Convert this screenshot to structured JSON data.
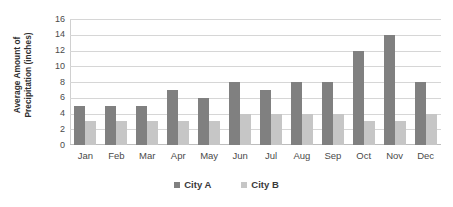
{
  "chart_data": {
    "type": "bar",
    "title": "",
    "xlabel": "",
    "ylabel": "Average Amount of Precipitation (inches)",
    "ylabel_line1": "Average Amount of",
    "ylabel_line2": "Precipitation (inches)",
    "categories": [
      "Jan",
      "Feb",
      "Mar",
      "Apr",
      "May",
      "Jun",
      "Jul",
      "Aug",
      "Sep",
      "Oct",
      "Nov",
      "Dec"
    ],
    "series": [
      {
        "name": "City A",
        "color": "#808080",
        "values": [
          5,
          5,
          5,
          7,
          6,
          8,
          7,
          8,
          8,
          12,
          14,
          8
        ]
      },
      {
        "name": "City B",
        "color": "#c6c6c6",
        "values": [
          3,
          3,
          3,
          3,
          3,
          4,
          4,
          4,
          4,
          3,
          3,
          4
        ]
      }
    ],
    "ylim": [
      0,
      16
    ],
    "ytick_values": [
      16,
      14,
      12,
      10,
      8,
      6,
      4,
      2,
      0
    ],
    "ytick_labels": [
      "16",
      "14",
      "12",
      "10",
      "8",
      "6",
      "4",
      "2",
      "0"
    ],
    "grid": true,
    "grid_axis": "y",
    "legend_position": "bottom"
  }
}
